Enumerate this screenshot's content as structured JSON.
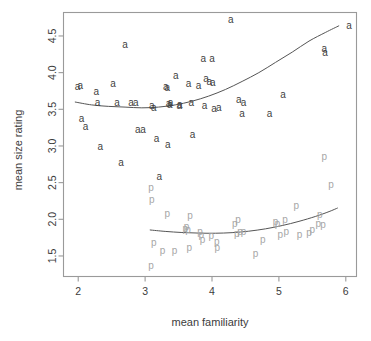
{
  "chart_data": {
    "type": "scatter",
    "title": "",
    "xlabel": "mean familiarity",
    "ylabel": "mean size rating",
    "xlim": [
      1.78,
      6.16
    ],
    "ylim": [
      1.22,
      4.82
    ],
    "xticks": [
      2,
      3,
      4,
      5,
      6
    ],
    "xticklabels": [
      "2",
      "3",
      "4",
      "5",
      "6"
    ],
    "yticks": [
      1.5,
      2.0,
      2.5,
      3.0,
      3.5,
      4.0,
      4.5
    ],
    "yticklabels": [
      "1.5",
      "2.0",
      "2.5",
      "3.0",
      "3.5",
      "4.0",
      "4.5"
    ],
    "grid": false,
    "legend": "none",
    "series": [
      {
        "name": "a",
        "marker": "a",
        "color": "#3f3f3f",
        "points": [
          [
            1.99,
            3.81
          ],
          [
            2.03,
            3.83
          ],
          [
            2.05,
            3.37
          ],
          [
            2.11,
            3.27
          ],
          [
            2.27,
            3.75
          ],
          [
            2.29,
            3.59
          ],
          [
            2.33,
            3.0
          ],
          [
            2.52,
            3.86
          ],
          [
            2.58,
            3.6
          ],
          [
            2.64,
            2.78
          ],
          [
            2.7,
            4.39
          ],
          [
            2.79,
            3.59
          ],
          [
            2.86,
            3.6
          ],
          [
            2.89,
            3.22
          ],
          [
            2.97,
            3.23
          ],
          [
            3.1,
            3.56
          ],
          [
            3.13,
            3.52
          ],
          [
            3.17,
            3.1
          ],
          [
            3.21,
            2.58
          ],
          [
            3.31,
            3.81
          ],
          [
            3.33,
            3.8
          ],
          [
            3.35,
            3.58
          ],
          [
            3.38,
            3.6
          ],
          [
            3.37,
            3.57
          ],
          [
            3.34,
            3.02
          ],
          [
            3.46,
            3.96
          ],
          [
            3.51,
            3.56
          ],
          [
            3.52,
            3.57
          ],
          [
            3.65,
            3.85
          ],
          [
            3.69,
            3.6
          ],
          [
            3.71,
            3.16
          ],
          [
            3.8,
            3.82
          ],
          [
            3.87,
            4.2
          ],
          [
            3.89,
            3.55
          ],
          [
            3.91,
            3.92
          ],
          [
            3.96,
            3.88
          ],
          [
            4.0,
            4.19
          ],
          [
            4.01,
            3.87
          ],
          [
            4.03,
            3.51
          ],
          [
            4.1,
            3.53
          ],
          [
            4.28,
            4.73
          ],
          [
            4.4,
            3.63
          ],
          [
            4.45,
            3.44
          ],
          [
            4.47,
            3.59
          ],
          [
            4.86,
            3.45
          ],
          [
            5.06,
            3.7
          ],
          [
            5.68,
            4.33
          ],
          [
            5.69,
            4.28
          ],
          [
            6.05,
            4.64
          ]
        ]
      },
      {
        "name": "p",
        "marker": "p",
        "color": "#a6a6a6",
        "points": [
          [
            3.09,
            2.43
          ],
          [
            3.1,
            2.27
          ],
          [
            3.09,
            1.37
          ],
          [
            3.13,
            1.69
          ],
          [
            3.26,
            1.58
          ],
          [
            3.33,
            2.08
          ],
          [
            3.44,
            1.58
          ],
          [
            3.6,
            1.88
          ],
          [
            3.64,
            1.86
          ],
          [
            3.62,
            1.9
          ],
          [
            3.67,
            2.05
          ],
          [
            3.66,
            1.62
          ],
          [
            3.82,
            1.84
          ],
          [
            3.84,
            1.79
          ],
          [
            3.86,
            1.72
          ],
          [
            3.99,
            1.78
          ],
          [
            4.07,
            1.7
          ],
          [
            4.08,
            1.62
          ],
          [
            4.34,
            1.95
          ],
          [
            4.39,
            2.0
          ],
          [
            4.37,
            1.81
          ],
          [
            4.42,
            1.83
          ],
          [
            4.47,
            1.84
          ],
          [
            4.65,
            1.54
          ],
          [
            4.76,
            1.72
          ],
          [
            4.95,
            1.97
          ],
          [
            4.98,
            1.95
          ],
          [
            5.02,
            1.79
          ],
          [
            5.09,
            2.0
          ],
          [
            5.11,
            1.83
          ],
          [
            5.26,
            2.19
          ],
          [
            5.31,
            1.8
          ],
          [
            5.45,
            1.82
          ],
          [
            5.5,
            1.86
          ],
          [
            5.59,
            1.94
          ],
          [
            5.61,
            2.07
          ],
          [
            5.66,
            1.93
          ],
          [
            5.68,
            2.86
          ],
          [
            5.78,
            2.47
          ]
        ]
      }
    ],
    "fit_curves": [
      {
        "name": "a-fit",
        "series": "a",
        "color": "#555555",
        "points": [
          [
            1.95,
            3.6
          ],
          [
            2.2,
            3.56
          ],
          [
            2.45,
            3.54
          ],
          [
            2.7,
            3.53
          ],
          [
            2.95,
            3.52
          ],
          [
            3.2,
            3.53
          ],
          [
            3.45,
            3.56
          ],
          [
            3.7,
            3.61
          ],
          [
            3.95,
            3.68
          ],
          [
            4.2,
            3.77
          ],
          [
            4.45,
            3.88
          ],
          [
            4.7,
            4.0
          ],
          [
            4.95,
            4.14
          ],
          [
            5.2,
            4.28
          ],
          [
            5.45,
            4.43
          ],
          [
            5.7,
            4.55
          ],
          [
            5.9,
            4.64
          ]
        ]
      },
      {
        "name": "p-fit",
        "series": "p",
        "color": "#555555",
        "points": [
          [
            3.07,
            1.855
          ],
          [
            3.3,
            1.835
          ],
          [
            3.55,
            1.82
          ],
          [
            3.8,
            1.812
          ],
          [
            4.05,
            1.81
          ],
          [
            4.3,
            1.818
          ],
          [
            4.55,
            1.838
          ],
          [
            4.8,
            1.87
          ],
          [
            5.05,
            1.915
          ],
          [
            5.3,
            1.972
          ],
          [
            5.55,
            2.04
          ],
          [
            5.75,
            2.105
          ],
          [
            5.88,
            2.155
          ]
        ]
      }
    ]
  }
}
